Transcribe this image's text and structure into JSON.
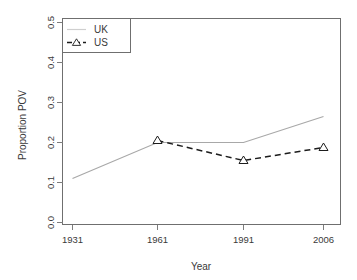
{
  "chart_data": {
    "type": "line",
    "title": "",
    "xlabel": "Year",
    "ylabel": "Proportion POV",
    "x": [
      1931,
      1961,
      1991,
      2006
    ],
    "xtick_labels": [
      "1931",
      "1961",
      "1991",
      "2006"
    ],
    "ytick_labels": [
      "0.0",
      "0.1",
      "0.2",
      "0.3",
      "0.4",
      "0.5"
    ],
    "ytick_values": [
      0.0,
      0.1,
      0.2,
      0.3,
      0.4,
      0.5
    ],
    "xlim": [
      1931,
      2006
    ],
    "ylim": [
      0.0,
      0.5
    ],
    "grid": false,
    "legend_position": "top-left",
    "series": [
      {
        "name": "UK",
        "values": [
          0.11,
          0.2,
          0.2,
          0.265
        ],
        "color": "#a8a8a8",
        "line_style": "solid",
        "marker": "none"
      },
      {
        "name": "US",
        "values": [
          null,
          0.205,
          0.155,
          0.1875
        ],
        "color": "#1c1c1c",
        "line_style": "dashed",
        "marker": "triangle"
      }
    ]
  },
  "axes": {
    "y_title": "Proportion POV",
    "x_title": "Year"
  },
  "legend": {
    "entries": [
      {
        "label": "UK"
      },
      {
        "label": "US"
      }
    ]
  }
}
